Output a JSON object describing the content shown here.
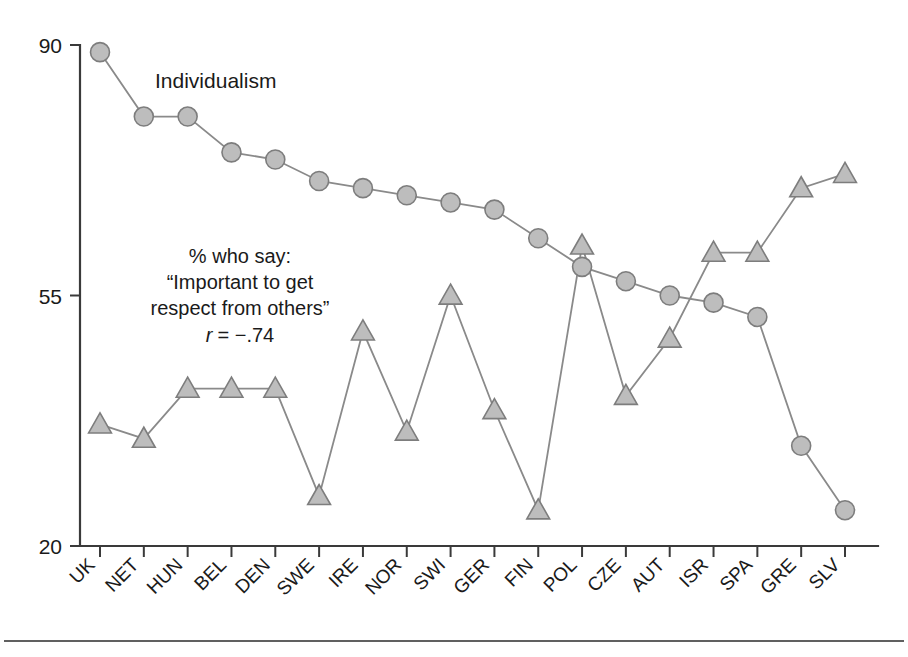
{
  "chart_data": {
    "type": "line",
    "title": "",
    "xlabel": "",
    "ylabel": "",
    "ylim": [
      20,
      90
    ],
    "ytick_values": [
      20,
      55,
      90
    ],
    "ytick_labels": [
      "20",
      "55",
      "90"
    ],
    "grid": false,
    "legend_position": "inline-annotations",
    "categories": [
      "UK",
      "NET",
      "HUN",
      "BEL",
      "DEN",
      "SWE",
      "IRE",
      "NOR",
      "SWI",
      "GER",
      "FIN",
      "POL",
      "CZE",
      "AUT",
      "ISR",
      "SPA",
      "GRE",
      "SLV"
    ],
    "series": [
      {
        "name": "Individualism",
        "marker": "circle",
        "values": [
          89,
          80,
          80,
          75,
          74,
          71,
          70,
          69,
          68,
          67,
          63,
          59,
          57,
          55,
          54,
          52,
          34,
          25
        ]
      },
      {
        "name": "% who say: “Important to get respect from others”",
        "marker": "triangle",
        "values": [
          37,
          35,
          42,
          42,
          42,
          27,
          50,
          36,
          55,
          39,
          25,
          62,
          41,
          49,
          61,
          61,
          70,
          72
        ]
      }
    ],
    "annotations": [
      {
        "id": "series-1-label",
        "text": "Individualism",
        "x": 0.9,
        "y": 85
      },
      {
        "id": "series-2-label-line-1",
        "text": "% who say:",
        "x": 1.4,
        "y": 59.5
      },
      {
        "id": "series-2-label-line-2",
        "text": "“Important to get",
        "x": 1.4,
        "y": 56.5
      },
      {
        "id": "series-2-label-line-3",
        "text": "respect from others”",
        "x": 1.4,
        "y": 53.5
      },
      {
        "id": "correlation",
        "text": "r = −.74",
        "r_symbol": "r",
        "equals": "= −.74",
        "value": -0.74,
        "x": 1.4,
        "y": 50.5
      }
    ],
    "colors": {
      "marker_fill": "#bdbdbd",
      "marker_stroke": "#7d7d7d",
      "line": "#8a8a8a",
      "axis": "#3a3a3a",
      "text": "#1a1a1a",
      "background": "#ffffff"
    }
  },
  "figure": {
    "bottom_rule": true
  }
}
